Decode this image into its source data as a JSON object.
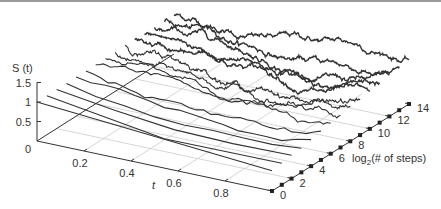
{
  "chart_data": {
    "type": "line",
    "projection": "3d-waterfall",
    "title": "",
    "zlabel": "S(t)",
    "xlabel": "t",
    "ylabel": "log2(# of steps)",
    "x_ticks": [
      "0.2",
      "0.4",
      "0.6",
      "0.8"
    ],
    "x_origin_label": "0",
    "z_ticks": [
      "0.5",
      "1",
      "1.5"
    ],
    "y_ticks": [
      "0",
      "2",
      "4",
      "6",
      "8",
      "10",
      "12",
      "14"
    ],
    "xlim": [
      0,
      1
    ],
    "zlim": [
      0,
      1.5
    ],
    "ylim": [
      0,
      14
    ],
    "grid": true,
    "series_count": 15,
    "series_description": "Random-walk approximations S(t) on t in [0,1] with 2^k steps, k = 0..14; start value S(0)=1, endpoint marked with a square dot",
    "start_value": 1.0,
    "end_values_approx": [
      0.52,
      0.55,
      0.6,
      0.62,
      0.68,
      0.74,
      0.78,
      0.82,
      0.88,
      0.92,
      0.98,
      1.02,
      1.08,
      1.12,
      1.15
    ],
    "line_color": "#333333",
    "grid_color": "#cccccc",
    "axis_color": "#333333"
  },
  "labels": {
    "zlabel": "S (t)",
    "xlabel": "t",
    "ylabel_prefix": "log",
    "ylabel_sub": "2",
    "ylabel_suffix": "(# of steps)"
  }
}
